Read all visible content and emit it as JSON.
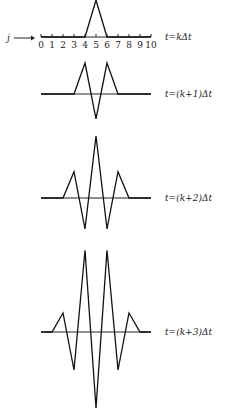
{
  "axis": {
    "variable": "j",
    "ticks": [
      "0",
      "1",
      "2",
      "3",
      "4",
      "5",
      "6",
      "7",
      "8",
      "9",
      "10"
    ]
  },
  "panels": [
    {
      "label": "t=kΔt",
      "baseline_y": 37,
      "unit_px": 37,
      "values": [
        0,
        0,
        0,
        0,
        0,
        1,
        0,
        0,
        0,
        0,
        0
      ]
    },
    {
      "label": "t=(k+1)Δt",
      "baseline_y": 94,
      "unit_px": 31,
      "values": [
        0,
        0,
        0,
        0,
        1,
        -0.8,
        1,
        0,
        0,
        0,
        0
      ]
    },
    {
      "label": "t=(k+2)Δt",
      "baseline_y": 198,
      "unit_px": 31,
      "values": [
        0,
        0,
        0,
        0.85,
        -1,
        2,
        -1,
        0.85,
        0,
        0,
        0
      ]
    },
    {
      "label": "t=(k+3)Δt",
      "baseline_y": 332,
      "unit_px": 19,
      "values": [
        0,
        0,
        1,
        -2,
        4.3,
        -4,
        4.3,
        -2,
        1,
        0,
        0
      ]
    }
  ],
  "chart_data": {
    "type": "line",
    "title": "",
    "xlabel": "j",
    "x": [
      0,
      1,
      2,
      3,
      4,
      5,
      6,
      7,
      8,
      9,
      10
    ],
    "series": [
      {
        "name": "t=kΔt",
        "values": [
          0,
          0,
          0,
          0,
          0,
          1,
          0,
          0,
          0,
          0,
          0
        ]
      },
      {
        "name": "t=(k+1)Δt",
        "values": [
          0,
          0,
          0,
          0,
          1,
          -0.8,
          1,
          0,
          0,
          0,
          0
        ]
      },
      {
        "name": "t=(k+2)Δt",
        "values": [
          0,
          0,
          0,
          0.85,
          -1,
          2,
          -1,
          0.85,
          0,
          0,
          0
        ]
      },
      {
        "name": "t=(k+3)Δt",
        "values": [
          0,
          0,
          1,
          -2,
          4.3,
          -4,
          4.3,
          -2,
          1,
          0,
          0
        ]
      }
    ]
  }
}
